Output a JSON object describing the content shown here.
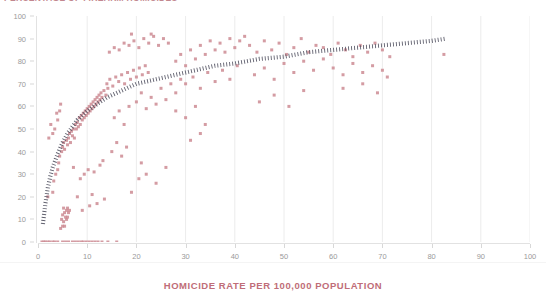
{
  "chart_data": {
    "type": "scatter",
    "title": "PERCENTAGE OF FIREARM HOMICIDES",
    "xlabel": "HOMICIDE RATE PER 100,000 POPULATION",
    "ylabel": "",
    "xlim": [
      0,
      100
    ],
    "ylim": [
      0,
      100
    ],
    "xticks": [
      0,
      10,
      20,
      30,
      40,
      50,
      60,
      70,
      80,
      90,
      100
    ],
    "yticks": [
      0,
      10,
      20,
      30,
      40,
      50,
      60,
      70,
      80,
      90,
      100
    ],
    "grid": "vertical",
    "legend": "none",
    "marker_color": "#cc8b93",
    "marker_shape": "square",
    "trendline": {
      "style": "dotted",
      "color": "#4a4a5a",
      "kind": "logarithmic",
      "points": [
        [
          1.0,
          8
        ],
        [
          1.5,
          17
        ],
        [
          2.0,
          24
        ],
        [
          2.5,
          29
        ],
        [
          3.0,
          33
        ],
        [
          3.5,
          36
        ],
        [
          4.0,
          39
        ],
        [
          5.0,
          44
        ],
        [
          6.0,
          48
        ],
        [
          7.0,
          51
        ],
        [
          8.0,
          54
        ],
        [
          9.0,
          56
        ],
        [
          10.0,
          58
        ],
        [
          12.0,
          61
        ],
        [
          14.0,
          64
        ],
        [
          16.0,
          66
        ],
        [
          18.0,
          68
        ],
        [
          20.0,
          70
        ],
        [
          24.0,
          72
        ],
        [
          28.0,
          74
        ],
        [
          32.0,
          76
        ],
        [
          36.0,
          78
        ],
        [
          40.0,
          79
        ],
        [
          45.0,
          81
        ],
        [
          50.0,
          82
        ],
        [
          55.0,
          84
        ],
        [
          60.0,
          85
        ],
        [
          65.0,
          86
        ],
        [
          70.0,
          87
        ],
        [
          75.0,
          88
        ],
        [
          80.0,
          89
        ],
        [
          83.0,
          90
        ]
      ]
    },
    "points": [
      [
        0.8,
        0
      ],
      [
        1.2,
        0
      ],
      [
        1.5,
        0
      ],
      [
        2.0,
        0
      ],
      [
        2.4,
        0
      ],
      [
        3.0,
        0
      ],
      [
        3.4,
        0
      ],
      [
        4.0,
        0
      ],
      [
        5.0,
        0
      ],
      [
        5.6,
        0
      ],
      [
        6.2,
        0
      ],
      [
        7.0,
        0
      ],
      [
        7.6,
        0
      ],
      [
        8.2,
        0
      ],
      [
        8.8,
        0
      ],
      [
        9.2,
        0
      ],
      [
        9.8,
        0
      ],
      [
        10.4,
        0
      ],
      [
        11.0,
        0
      ],
      [
        11.6,
        0
      ],
      [
        12.2,
        0
      ],
      [
        13.0,
        0
      ],
      [
        14.2,
        0
      ],
      [
        16.0,
        0
      ],
      [
        4.6,
        6
      ],
      [
        5.0,
        7
      ],
      [
        5.4,
        7
      ],
      [
        5.2,
        9
      ],
      [
        5.8,
        10
      ],
      [
        4.8,
        10
      ],
      [
        5.6,
        11
      ],
      [
        6.0,
        11
      ],
      [
        5.0,
        12
      ],
      [
        5.4,
        13
      ],
      [
        6.2,
        13
      ],
      [
        5.8,
        14
      ],
      [
        6.4,
        14
      ],
      [
        5.2,
        15
      ],
      [
        6.0,
        15
      ],
      [
        2.0,
        20
      ],
      [
        3.0,
        22
      ],
      [
        9.0,
        14
      ],
      [
        10.5,
        16
      ],
      [
        12.0,
        17
      ],
      [
        8.0,
        20
      ],
      [
        11.0,
        21
      ],
      [
        13.5,
        19
      ],
      [
        3.2,
        27
      ],
      [
        3.6,
        30
      ],
      [
        4.0,
        32
      ],
      [
        4.2,
        35
      ],
      [
        8.6,
        28
      ],
      [
        9.4,
        30
      ],
      [
        10.2,
        32
      ],
      [
        11.4,
        31
      ],
      [
        7.2,
        33
      ],
      [
        12.6,
        34
      ],
      [
        13.2,
        36
      ],
      [
        4.4,
        38
      ],
      [
        4.8,
        40
      ],
      [
        5.0,
        42
      ],
      [
        5.2,
        44
      ],
      [
        5.4,
        41
      ],
      [
        5.8,
        45
      ],
      [
        6.0,
        43
      ],
      [
        6.2,
        46
      ],
      [
        6.4,
        48
      ],
      [
        6.6,
        44
      ],
      [
        6.8,
        49
      ],
      [
        7.0,
        47
      ],
      [
        7.2,
        50
      ],
      [
        7.4,
        46
      ],
      [
        7.6,
        52
      ],
      [
        7.8,
        50
      ],
      [
        8.0,
        53
      ],
      [
        8.2,
        51
      ],
      [
        8.4,
        55
      ],
      [
        8.6,
        52
      ],
      [
        8.8,
        56
      ],
      [
        9.0,
        54
      ],
      [
        9.2,
        57
      ],
      [
        9.4,
        55
      ],
      [
        9.6,
        58
      ],
      [
        9.8,
        56
      ],
      [
        10.0,
        59
      ],
      [
        10.2,
        57
      ],
      [
        10.4,
        60
      ],
      [
        10.6,
        58
      ],
      [
        10.8,
        61
      ],
      [
        11.0,
        59
      ],
      [
        11.2,
        62
      ],
      [
        11.4,
        60
      ],
      [
        11.6,
        63
      ],
      [
        11.8,
        61
      ],
      [
        12.0,
        64
      ],
      [
        12.2,
        62
      ],
      [
        12.4,
        65
      ],
      [
        12.6,
        63
      ],
      [
        12.8,
        66
      ],
      [
        13.0,
        64
      ],
      [
        13.4,
        67
      ],
      [
        13.8,
        65
      ],
      [
        14.2,
        68
      ],
      [
        3.0,
        48
      ],
      [
        3.4,
        50
      ],
      [
        2.6,
        52
      ],
      [
        4.0,
        54
      ],
      [
        3.8,
        57
      ],
      [
        2.2,
        46
      ],
      [
        4.4,
        58
      ],
      [
        4.6,
        61
      ],
      [
        15.0,
        40
      ],
      [
        16.0,
        44
      ],
      [
        17.0,
        38
      ],
      [
        18.0,
        42
      ],
      [
        15.5,
        55
      ],
      [
        16.5,
        58
      ],
      [
        17.5,
        52
      ],
      [
        18.5,
        60
      ],
      [
        14.0,
        70
      ],
      [
        14.6,
        72
      ],
      [
        15.2,
        69
      ],
      [
        15.8,
        73
      ],
      [
        16.4,
        71
      ],
      [
        17.0,
        74
      ],
      [
        17.6,
        70
      ],
      [
        18.2,
        75
      ],
      [
        18.8,
        72
      ],
      [
        19.4,
        76
      ],
      [
        20.0,
        73
      ],
      [
        20.6,
        77
      ],
      [
        21.2,
        74
      ],
      [
        21.8,
        78
      ],
      [
        22.4,
        75
      ],
      [
        14.5,
        84
      ],
      [
        15.5,
        86
      ],
      [
        16.5,
        85
      ],
      [
        17.5,
        88
      ],
      [
        18.5,
        87
      ],
      [
        19.5,
        89
      ],
      [
        20.5,
        86
      ],
      [
        21.5,
        90
      ],
      [
        22.5,
        88
      ],
      [
        23.5,
        91
      ],
      [
        24.5,
        87
      ],
      [
        25.5,
        90
      ],
      [
        26.5,
        88
      ],
      [
        19.0,
        92
      ],
      [
        23.0,
        92
      ],
      [
        20.0,
        62
      ],
      [
        21.0,
        66
      ],
      [
        22.0,
        59
      ],
      [
        23.0,
        64
      ],
      [
        24.0,
        61
      ],
      [
        25.0,
        68
      ],
      [
        26.0,
        63
      ],
      [
        27.0,
        70
      ],
      [
        28.0,
        66
      ],
      [
        29.0,
        72
      ],
      [
        22.0,
        30
      ],
      [
        24.0,
        26
      ],
      [
        21.0,
        35
      ],
      [
        26.0,
        33
      ],
      [
        19.0,
        22
      ],
      [
        20.5,
        28
      ],
      [
        28.0,
        80
      ],
      [
        29.0,
        83
      ],
      [
        30.0,
        78
      ],
      [
        31.0,
        85
      ],
      [
        32.0,
        81
      ],
      [
        33.0,
        87
      ],
      [
        34.0,
        83
      ],
      [
        35.0,
        89
      ],
      [
        36.0,
        85
      ],
      [
        37.0,
        88
      ],
      [
        38.0,
        84
      ],
      [
        39.0,
        90
      ],
      [
        40.0,
        86
      ],
      [
        41.0,
        89
      ],
      [
        42.0,
        91
      ],
      [
        30.0,
        70
      ],
      [
        31.5,
        73
      ],
      [
        33.0,
        68
      ],
      [
        34.5,
        75
      ],
      [
        36.0,
        71
      ],
      [
        37.5,
        76
      ],
      [
        39.0,
        72
      ],
      [
        40.5,
        78
      ],
      [
        28.0,
        58
      ],
      [
        30.0,
        55
      ],
      [
        32.0,
        60
      ],
      [
        34.0,
        52
      ],
      [
        31.0,
        45
      ],
      [
        33.0,
        48
      ],
      [
        43.0,
        87
      ],
      [
        44.5,
        84
      ],
      [
        46.0,
        89
      ],
      [
        47.5,
        85
      ],
      [
        49.0,
        88
      ],
      [
        50.5,
        83
      ],
      [
        52.0,
        86
      ],
      [
        53.5,
        90
      ],
      [
        55.0,
        84
      ],
      [
        56.5,
        87
      ],
      [
        44.0,
        74
      ],
      [
        46.0,
        77
      ],
      [
        48.0,
        72
      ],
      [
        50.0,
        79
      ],
      [
        52.0,
        75
      ],
      [
        54.0,
        80
      ],
      [
        56.0,
        76
      ],
      [
        58.0,
        81
      ],
      [
        45.0,
        62
      ],
      [
        48.0,
        65
      ],
      [
        51.0,
        60
      ],
      [
        54.0,
        67
      ],
      [
        58.0,
        86
      ],
      [
        59.5,
        83
      ],
      [
        61.0,
        88
      ],
      [
        62.5,
        85
      ],
      [
        64.0,
        82
      ],
      [
        65.5,
        87
      ],
      [
        67.0,
        84
      ],
      [
        68.5,
        88
      ],
      [
        70.0,
        85
      ],
      [
        71.5,
        82
      ],
      [
        60.0,
        77
      ],
      [
        62.0,
        74
      ],
      [
        64.0,
        79
      ],
      [
        66.0,
        75
      ],
      [
        68.0,
        78
      ],
      [
        70.0,
        76
      ],
      [
        71.0,
        73
      ],
      [
        62.0,
        68
      ],
      [
        66.0,
        70
      ],
      [
        69.0,
        66
      ],
      [
        82.5,
        83
      ]
    ]
  },
  "axes": {
    "y_tick_labels": [
      "0",
      "10",
      "20",
      "30",
      "40",
      "50",
      "60",
      "70",
      "80",
      "90",
      "100"
    ],
    "x_tick_labels": [
      "0",
      "10",
      "20",
      "30",
      "40",
      "50",
      "60",
      "70",
      "80",
      "90",
      "100"
    ]
  }
}
